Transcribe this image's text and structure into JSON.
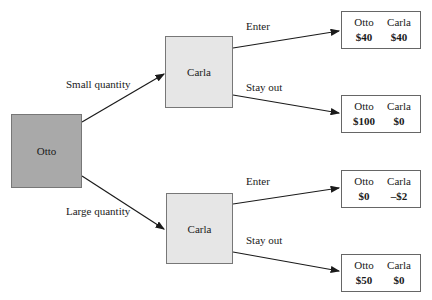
{
  "diagram": {
    "type": "game-tree",
    "root": {
      "label": "Otto"
    },
    "branches": [
      {
        "label": "Small quantity",
        "node": {
          "label": "Carla"
        },
        "outcomes": [
          {
            "label": "Enter",
            "payoff": {
              "p1_name": "Otto",
              "p1_value": "$40",
              "p2_name": "Carla",
              "p2_value": "$40"
            }
          },
          {
            "label": "Stay out",
            "payoff": {
              "p1_name": "Otto",
              "p1_value": "$100",
              "p2_name": "Carla",
              "p2_value": "$0"
            }
          }
        ]
      },
      {
        "label": "Large quantity",
        "node": {
          "label": "Carla"
        },
        "outcomes": [
          {
            "label": "Enter",
            "payoff": {
              "p1_name": "Otto",
              "p1_value": "$0",
              "p2_name": "Carla",
              "p2_value": "–$2"
            }
          },
          {
            "label": "Stay out",
            "payoff": {
              "p1_name": "Otto",
              "p1_value": "$50",
              "p2_name": "Carla",
              "p2_value": "$0"
            }
          }
        ]
      }
    ],
    "colors": {
      "otto_node": "#a9a9a9",
      "carla_node": "#e6e6e6",
      "edge": "#1a1a1a"
    }
  }
}
